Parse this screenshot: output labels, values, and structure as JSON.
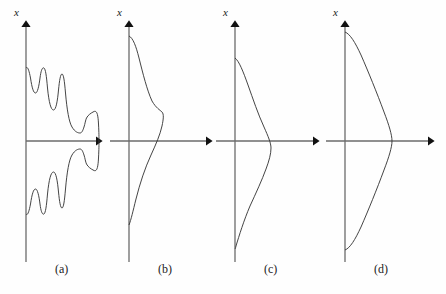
{
  "figure": {
    "background_color": "#fefefe",
    "axis_color": "#6b6b6b",
    "curve_color": "#3a3a3a",
    "arrow_color": "#111111",
    "caption_color": "#222222",
    "width": 446,
    "height": 294
  },
  "axis_label_text": "x",
  "panels": [
    {
      "id": "a",
      "caption": "(a)",
      "caption_x": 55,
      "caption_y": 270,
      "axis_x": 26,
      "axis_top_y": 18,
      "axis_bottom_y": 262,
      "h_axis_y": 141,
      "h_axis_end_x": 105,
      "label_x": 14,
      "label_y": 14,
      "curve_type": "oscillatory-sinc",
      "description": "Rapidly oscillating sinc-like profile with a tall narrow central lobe and several decaying side lobes, all positive-going to the right of the axis",
      "curve_top_y": 68,
      "curve_bottom_y": 215,
      "main_lobe_peak_x": 98,
      "main_lobe_peak_y": 141,
      "side_lobe_peaks_x": [
        72,
        48,
        37
      ],
      "node_count": 7
    },
    {
      "id": "b",
      "caption": "(b)",
      "caption_x": 158,
      "caption_y": 270,
      "axis_x": 129,
      "axis_top_y": 18,
      "axis_bottom_y": 262,
      "h_axis_y": 141,
      "h_axis_end_x": 215,
      "label_x": 117,
      "label_y": 14,
      "curve_type": "single-peak-above-axis",
      "description": "Broad single-lobed profile whose maximum lies above the horizontal axis",
      "curve_top_y": 36,
      "curve_bottom_y": 225,
      "peak_x": 163,
      "peak_y": 110
    },
    {
      "id": "c",
      "caption": "(c)",
      "caption_x": 264,
      "caption_y": 270,
      "axis_x": 235,
      "axis_top_y": 18,
      "axis_bottom_y": 262,
      "h_axis_y": 141,
      "h_axis_end_x": 322,
      "label_x": 223,
      "label_y": 14,
      "curve_type": "single-peak-below-axis",
      "description": "Broad single-lobed profile, mirror of panel b, whose maximum lies below the horizontal axis",
      "curve_top_y": 58,
      "curve_bottom_y": 248,
      "peak_x": 270,
      "peak_y": 172
    },
    {
      "id": "d",
      "caption": "(d)",
      "caption_x": 374,
      "caption_y": 270,
      "axis_x": 345,
      "axis_top_y": 18,
      "axis_bottom_y": 262,
      "h_axis_y": 141,
      "h_axis_end_x": 437,
      "label_x": 333,
      "label_y": 14,
      "curve_type": "symmetric-peak-centered",
      "description": "Wide symmetric single-lobed profile centred exactly on the horizontal axis",
      "curve_top_y": 32,
      "curve_bottom_y": 250,
      "peak_x": 392,
      "peak_y": 141
    }
  ]
}
